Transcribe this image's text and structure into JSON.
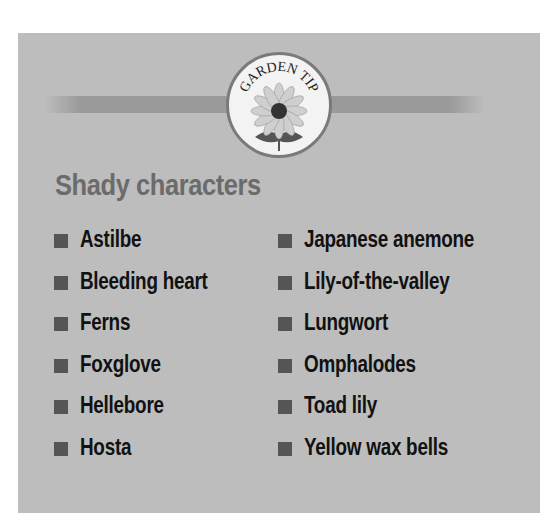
{
  "badge": {
    "text": "GARDEN TIP",
    "icon": "flower-icon"
  },
  "title": "Shady characters",
  "colors": {
    "panel": "#bdbdbd",
    "band": "#9a9a9a",
    "bullet": "#555555",
    "title": "#6b6b6b",
    "text": "#111111"
  },
  "plants": {
    "left": [
      "Astilbe",
      "Bleeding heart",
      "Ferns",
      "Foxglove",
      "Hellebore",
      "Hosta"
    ],
    "right": [
      "Japanese anemone",
      "Lily-of-the-valley",
      "Lungwort",
      "Omphalodes",
      "Toad lily",
      "Yellow wax bells"
    ]
  }
}
